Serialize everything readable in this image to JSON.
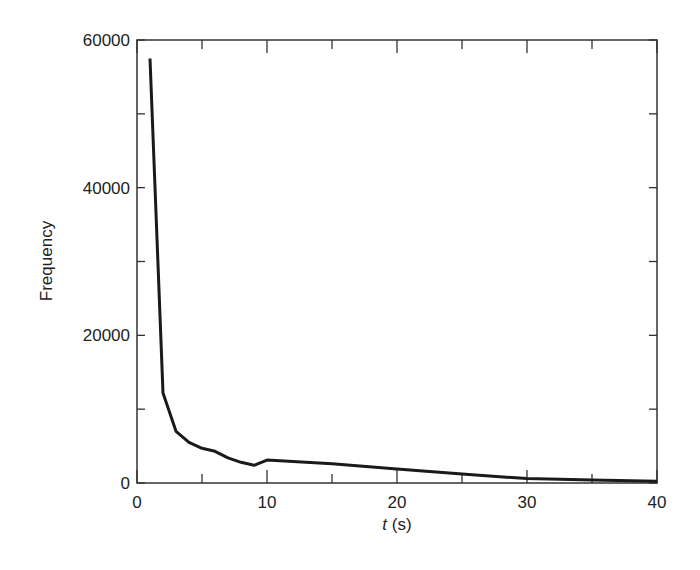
{
  "chart_data": {
    "type": "line",
    "title": "",
    "xlabel_italic": "t",
    "xlabel_rest": " (s)",
    "xlabel": "t (s)",
    "ylabel": "Frequency",
    "xlim": [
      0,
      40
    ],
    "ylim": [
      0,
      60000
    ],
    "xticks": [
      0,
      10,
      20,
      30,
      40
    ],
    "xticks_minor": [
      5,
      15,
      25,
      35
    ],
    "yticks": [
      0,
      20000,
      40000,
      60000
    ],
    "yticks_minor": [
      10000,
      30000,
      50000
    ],
    "xtick_labels": [
      "0",
      "10",
      "20",
      "30",
      "40"
    ],
    "ytick_labels": [
      "0",
      "20000",
      "40000",
      "60000"
    ],
    "grid": false,
    "legend": null,
    "series": [
      {
        "name": "Frequency",
        "color": "#1a1a1a",
        "x": [
          1,
          2,
          3,
          4,
          5,
          6,
          7,
          8,
          9,
          10,
          15,
          20,
          25,
          30,
          35,
          40
        ],
        "y": [
          57500,
          12200,
          7000,
          5500,
          4700,
          4300,
          3400,
          2800,
          2400,
          3100,
          2600,
          1900,
          1200,
          600,
          400,
          250
        ]
      }
    ]
  }
}
